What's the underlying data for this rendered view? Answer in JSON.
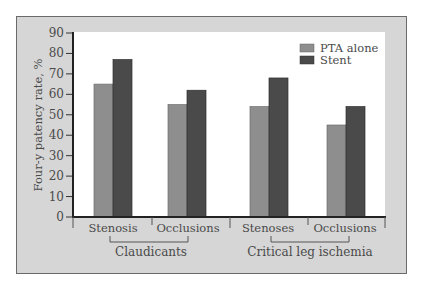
{
  "chart_data": {
    "type": "bar",
    "title": "",
    "xlabel": "",
    "ylabel": "Four-y patency rate, %",
    "ylim": [
      0,
      90
    ],
    "yticks": [
      0,
      10,
      20,
      30,
      40,
      50,
      60,
      70,
      80,
      90
    ],
    "grid": false,
    "legend_position": "upper right",
    "categories": [
      "Stenosis",
      "Occlusions",
      "Stenoses",
      "Occlusions"
    ],
    "category_groups": [
      {
        "label": "Claudicants",
        "categories": [
          "Stenosis",
          "Occlusions"
        ]
      },
      {
        "label": "Critical leg ischemia",
        "categories": [
          "Stenoses",
          "Occlusions"
        ]
      }
    ],
    "series": [
      {
        "name": "PTA alone",
        "color": "#8e8e8e",
        "values": [
          65,
          55,
          54,
          45
        ]
      },
      {
        "name": "Stent",
        "color": "#4a4a4a",
        "values": [
          77,
          62,
          68,
          54
        ]
      }
    ]
  },
  "labels": {
    "ylabel": "Four-y patency rate, %",
    "legend": [
      "PTA alone",
      "Stent"
    ],
    "categories": [
      "Stenosis",
      "Occlusions",
      "Stenoses",
      "Occlusions"
    ],
    "groups": [
      "Claudicants",
      "Critical leg ischemia"
    ],
    "yticks": [
      "0",
      "10",
      "20",
      "30",
      "40",
      "50",
      "60",
      "70",
      "80",
      "90"
    ]
  },
  "colors": {
    "frame_bg": "#d6d6d6",
    "plot_bg": "#ffffff",
    "pta": "#8e8e8e",
    "stent": "#4a4a4a",
    "axis": "#222222",
    "text": "#4a4a4a"
  }
}
